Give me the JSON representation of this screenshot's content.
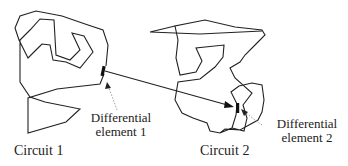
{
  "diagram": {
    "circuits": [
      {
        "id": "circuit-1",
        "label": "Circuit 1"
      },
      {
        "id": "circuit-2",
        "label": "Circuit 2"
      }
    ],
    "elements": [
      {
        "id": "element-1",
        "line1": "Differential",
        "line2": "element 1"
      },
      {
        "id": "element-2",
        "line1": "Differential",
        "line2": "element 2"
      }
    ],
    "colors": {
      "stroke": "#222222",
      "pointer": "#888888",
      "background": "#ffffff"
    }
  }
}
